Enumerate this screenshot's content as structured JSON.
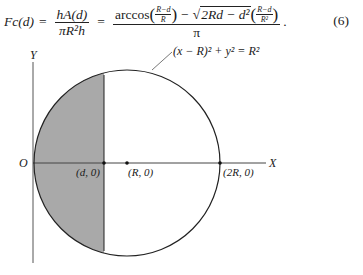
{
  "equation": {
    "lhs": "Fc(d)",
    "equals": "=",
    "frac1_num": "hA(d)",
    "frac1_den": "πR²h",
    "frac2_num_arccos": "arccos",
    "frac2_num_arg_num": "R−d",
    "frac2_num_arg_den": "R",
    "frac2_num_minus": "−",
    "frac2_num_sqrt": "2Rd − d²",
    "frac2_num_tail_num": "R−d",
    "frac2_num_tail_den": "R²",
    "frac2_den": "π",
    "period": ".",
    "number": "(6)"
  },
  "figure": {
    "circle_label": "(x − R)² + y² = R²",
    "y_axis_label": "Y",
    "x_axis_label": "X",
    "origin_label": "O",
    "point_d_label": "(d, 0)",
    "point_r_label": "(R, 0)",
    "point_2r_label": "(2R, 0)",
    "shade_color": "#a9a9a9",
    "line_color": "#222222"
  }
}
